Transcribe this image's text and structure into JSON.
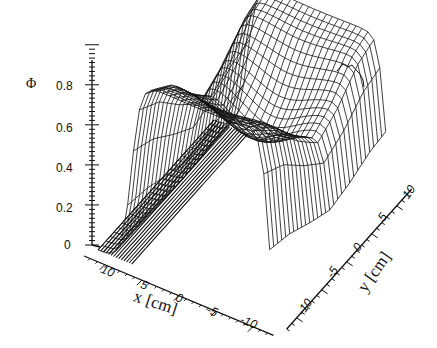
{
  "chart_data": {
    "type": "surface3d",
    "title": "",
    "zlabel": "Φ",
    "xlabel": "x [cm]",
    "ylabel": "y [cm]",
    "z_ticks": [
      "0",
      "0.2",
      "0.4",
      "0.6",
      "0.8"
    ],
    "x_ticks": [
      "10",
      "5",
      "0",
      "-5",
      "-10"
    ],
    "y_ticks": [
      "-10",
      "-5",
      "0",
      "5",
      "10"
    ],
    "zlim": [
      0,
      0.9
    ],
    "xlim": [
      -12,
      12
    ],
    "ylim": [
      -12,
      12
    ],
    "ridge_profile": {
      "y": [
        -12,
        -8,
        -4,
        0,
        4,
        8,
        12
      ],
      "phi_max": [
        0.9,
        0.82,
        0.68,
        0.56,
        0.62,
        0.72,
        0.76
      ]
    }
  }
}
